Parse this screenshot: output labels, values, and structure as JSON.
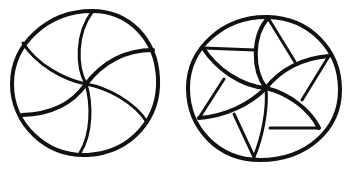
{
  "figure": {
    "description": "Two hand-drawn circular line diagrams: a pinwheel with six curved spiral arms (left) and a circle with five curved arms plus straight chords forming a star/pinwheel pattern (right).",
    "stroke_color": "#111111",
    "background": "#ffffff"
  },
  "diagrams": [
    {
      "name": "six-arm-spiral",
      "center": [
        86,
        84
      ],
      "radius": 72,
      "arm_count": 6
    },
    {
      "name": "five-arm-star-pinwheel",
      "center": [
        266,
        88
      ],
      "radius": 77,
      "arm_count": 5
    }
  ]
}
